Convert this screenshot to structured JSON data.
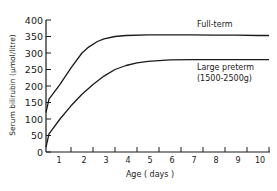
{
  "chart_data": {
    "type": "line",
    "title": "",
    "xlabel": "Age ( days )",
    "ylabel": "Serum bilirubin (μmol/litre)",
    "xlim": [
      0,
      10.5
    ],
    "ylim": [
      0,
      400
    ],
    "x_ticks": [
      "1",
      "2",
      "3",
      "4",
      "5",
      "6",
      "7",
      "8",
      "9",
      "10"
    ],
    "y_ticks": [
      "0",
      "50",
      "100",
      "150",
      "200",
      "250",
      "300",
      "350",
      "400"
    ],
    "grid": false,
    "legend": "inline labels",
    "series": [
      {
        "name": "Full-term",
        "label_lines": [
          "Full-term"
        ],
        "x": [
          0,
          0.5,
          1,
          1.5,
          2,
          2.3,
          2.7,
          3,
          3.5,
          4,
          5,
          6,
          7,
          8,
          9,
          10,
          10.5
        ],
        "values": [
          120,
          160,
          205,
          255,
          300,
          318,
          335,
          343,
          350,
          353,
          355,
          355,
          355,
          354,
          354,
          353,
          353
        ]
      },
      {
        "name": "Large preterm (1500-2500g)",
        "label_lines": [
          "Large preterm",
          "(1500-2500g)"
        ],
        "x": [
          0,
          0.5,
          1,
          1.5,
          2,
          2.5,
          3,
          3.5,
          4,
          4.5,
          5,
          6,
          7,
          8,
          9,
          10,
          10.5
        ],
        "values": [
          15,
          55,
          100,
          140,
          175,
          205,
          230,
          250,
          262,
          270,
          275,
          279,
          280,
          280,
          280,
          280,
          280
        ]
      }
    ]
  }
}
